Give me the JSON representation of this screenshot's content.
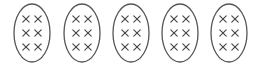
{
  "diagram": {
    "groups": [
      {
        "id": 1,
        "cx": 32,
        "count": 6
      },
      {
        "id": 2,
        "cx": 82,
        "count": 6
      },
      {
        "id": 3,
        "cx": 131,
        "count": 6
      },
      {
        "id": 4,
        "cx": 180,
        "count": 6
      },
      {
        "id": 5,
        "cx": 229,
        "count": 6
      }
    ],
    "ellipse": {
      "cy": 33,
      "rx": 18,
      "ry": 29,
      "stroke": "#555555"
    },
    "mark": {
      "symbol": "x",
      "columns": 2,
      "rows": 3,
      "dx": 6,
      "dy": 14,
      "size": 3.2,
      "stroke": "#444444"
    }
  }
}
